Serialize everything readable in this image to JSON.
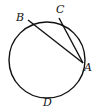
{
  "diagram": {
    "type": "circle-chords",
    "circle": {
      "cx": 47,
      "cy": 60,
      "r": 38
    },
    "points": {
      "B": {
        "label": "B",
        "x": 28,
        "y": 20,
        "lx": 16,
        "ly": 21
      },
      "C": {
        "label": "C",
        "x": 59,
        "y": 18,
        "lx": 56,
        "ly": 13
      },
      "A": {
        "label": "A",
        "x": 83,
        "y": 63,
        "lx": 84,
        "ly": 71
      },
      "D": {
        "label": "D",
        "x": 47,
        "y": 98,
        "lx": 43,
        "ly": 106
      }
    },
    "segments": [
      [
        "B",
        "A"
      ],
      [
        "C",
        "A"
      ]
    ],
    "stroke_color": "#111111"
  }
}
